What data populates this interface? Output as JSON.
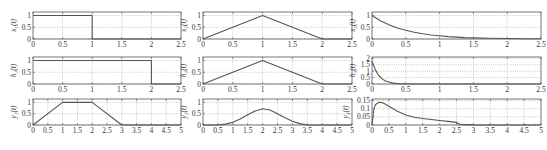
{
  "figure": {
    "top_caption_fragment": "",
    "bottom_caption_fragment": ""
  },
  "chart_data": [
    {
      "type": "line",
      "id": "x1",
      "ylabel": "x₁(t)",
      "row": 0,
      "col": 0,
      "xlim": [
        0,
        2.5
      ],
      "ylim": [
        0,
        1.15
      ],
      "xticks": [
        0,
        0.5,
        1,
        1.5,
        2,
        2.5
      ],
      "xtick_labels": [
        "0",
        "0.5",
        "1",
        "1.5",
        "2",
        "2.5"
      ],
      "yticks": [
        0,
        0.5,
        1
      ],
      "ytick_labels": [
        "0",
        "0.5",
        "1"
      ],
      "grid": true,
      "series": [
        {
          "name": "x1(t)",
          "x": [
            0,
            1,
            1,
            2.5
          ],
          "y": [
            1,
            1,
            0,
            0
          ]
        }
      ]
    },
    {
      "type": "line",
      "id": "x2",
      "ylabel": "x₂(t)",
      "row": 0,
      "col": 1,
      "xlim": [
        0,
        2.5
      ],
      "ylim": [
        0,
        1.15
      ],
      "xticks": [
        0,
        0.5,
        1,
        1.5,
        2,
        2.5
      ],
      "xtick_labels": [
        "0",
        "0.5",
        "1",
        "1.5",
        "2",
        "2.5"
      ],
      "yticks": [
        0,
        0.5,
        1
      ],
      "ytick_labels": [
        "0",
        "0.5",
        "1"
      ],
      "grid": true,
      "series": [
        {
          "name": "x2(t)",
          "x": [
            0,
            1,
            2,
            2.5
          ],
          "y": [
            0,
            1,
            0,
            0
          ]
        }
      ]
    },
    {
      "type": "line",
      "id": "x3",
      "ylabel": "x₃(t)",
      "row": 0,
      "col": 2,
      "xlim": [
        0,
        2.5
      ],
      "ylim": [
        0,
        1.15
      ],
      "xticks": [
        0,
        0.5,
        1,
        1.5,
        2,
        2.5
      ],
      "xtick_labels": [
        "0",
        "0.5",
        "1",
        "1.5",
        "2",
        "2.5"
      ],
      "yticks": [
        0,
        0.5,
        1
      ],
      "ytick_labels": [
        "0",
        "0.5",
        "1"
      ],
      "grid": true,
      "series": [
        {
          "name": "x3(t)",
          "x": [
            0,
            0.125,
            0.25,
            0.375,
            0.5,
            0.625,
            0.75,
            0.875,
            1,
            1.125,
            1.25,
            1.375,
            1.5,
            1.75,
            2,
            2.25,
            2.5
          ],
          "y": [
            1,
            0.78,
            0.61,
            0.47,
            0.37,
            0.29,
            0.22,
            0.17,
            0.14,
            0.1,
            0.08,
            0.06,
            0.05,
            0.03,
            0.02,
            0.01,
            0.01
          ]
        }
      ]
    },
    {
      "type": "line",
      "id": "h1",
      "ylabel": "h₁(t)",
      "row": 1,
      "col": 0,
      "xlim": [
        0,
        2.5
      ],
      "ylim": [
        0,
        1.15
      ],
      "xticks": [
        0,
        0.5,
        1,
        1.5,
        2,
        2.5
      ],
      "xtick_labels": [
        "0",
        "0.5",
        "1",
        "1.5",
        "2",
        "2.5"
      ],
      "yticks": [
        0,
        0.5,
        1
      ],
      "ytick_labels": [
        "0",
        "0.5",
        "1"
      ],
      "grid": true,
      "series": [
        {
          "name": "h1(t)",
          "x": [
            0,
            2,
            2,
            2.5
          ],
          "y": [
            1,
            1,
            0,
            0
          ]
        }
      ]
    },
    {
      "type": "line",
      "id": "h2",
      "ylabel": "h₂(t)",
      "row": 1,
      "col": 1,
      "xlim": [
        0,
        2.5
      ],
      "ylim": [
        0,
        1.15
      ],
      "xticks": [
        0,
        0.5,
        1,
        1.5,
        2,
        2.5
      ],
      "xtick_labels": [
        "0",
        "0.5",
        "1",
        "1.5",
        "2",
        "2.5"
      ],
      "yticks": [
        0,
        0.5,
        1
      ],
      "ytick_labels": [
        "0",
        "0.5",
        "1"
      ],
      "grid": true,
      "series": [
        {
          "name": "h2(t)",
          "x": [
            0,
            1,
            2,
            2.5
          ],
          "y": [
            0,
            1,
            0,
            0
          ]
        }
      ]
    },
    {
      "type": "line",
      "id": "h3",
      "ylabel": "h₃(t)",
      "row": 1,
      "col": 2,
      "xlim": [
        0,
        2.5
      ],
      "ylim": [
        0,
        2.1
      ],
      "xticks": [
        0,
        0.5,
        1,
        1.5,
        2,
        2.5
      ],
      "xtick_labels": [
        "0",
        "0.5",
        "1",
        "1.5",
        "2",
        "2.5"
      ],
      "yticks": [
        0,
        0.5,
        1,
        1.5,
        2
      ],
      "ytick_labels": [
        "0",
        "0.5",
        "1",
        "1.5",
        "2"
      ],
      "grid": true,
      "series": [
        {
          "name": "h3(t)",
          "x": [
            0,
            0.05,
            0.1,
            0.15,
            0.2,
            0.25,
            0.3,
            0.35,
            0.4,
            0.5,
            0.75,
            1,
            1.5,
            2,
            2.5
          ],
          "y": [
            1.8,
            1.1,
            0.66,
            0.4,
            0.24,
            0.15,
            0.09,
            0.05,
            0.03,
            0.01,
            0,
            0,
            0,
            0,
            0
          ]
        }
      ]
    },
    {
      "type": "line",
      "id": "y1",
      "ylabel": "y₁(t)",
      "row": 2,
      "col": 0,
      "xlim": [
        0,
        5
      ],
      "ylim": [
        0,
        1.15
      ],
      "xticks": [
        0,
        0.5,
        1,
        1.5,
        2,
        2.5,
        3,
        3.5,
        4,
        4.5,
        5
      ],
      "xtick_labels": [
        "0",
        "0.5",
        "1",
        "1.5",
        "2",
        "2.5",
        "3",
        "3.5",
        "4",
        "4.5",
        "5"
      ],
      "yticks": [
        0,
        0.5,
        1
      ],
      "ytick_labels": [
        "0",
        "0.5",
        "1"
      ],
      "grid": true,
      "series": [
        {
          "name": "y1(t)",
          "x": [
            0,
            1,
            2,
            3,
            5
          ],
          "y": [
            0,
            1,
            1,
            0,
            0
          ]
        }
      ]
    },
    {
      "type": "line",
      "id": "y2",
      "ylabel": "y₂(t)",
      "row": 2,
      "col": 1,
      "xlim": [
        0,
        5
      ],
      "ylim": [
        0,
        1.15
      ],
      "xticks": [
        0,
        0.5,
        1,
        1.5,
        2,
        2.5,
        3,
        3.5,
        4,
        4.5,
        5
      ],
      "xtick_labels": [
        "0",
        "0.5",
        "1",
        "1.5",
        "2",
        "2.5",
        "3",
        "3.5",
        "4",
        "4.5",
        "5"
      ],
      "yticks": [
        0,
        0.5,
        1
      ],
      "ytick_labels": [
        "0",
        "0.5",
        "1"
      ],
      "grid": true,
      "series": [
        {
          "name": "y2(t)",
          "x": [
            0,
            0.5,
            0.75,
            1,
            1.25,
            1.5,
            1.75,
            2,
            2.25,
            2.5,
            2.75,
            3,
            3.25,
            3.5,
            4,
            5
          ],
          "y": [
            0,
            0.0,
            0.04,
            0.12,
            0.27,
            0.45,
            0.62,
            0.72,
            0.66,
            0.5,
            0.32,
            0.17,
            0.06,
            0.0,
            0,
            0
          ]
        }
      ]
    },
    {
      "type": "line",
      "id": "y3",
      "ylabel": "y₃(t)",
      "row": 2,
      "col": 2,
      "xlim": [
        0,
        5
      ],
      "ylim": [
        0,
        0.16
      ],
      "xticks": [
        0,
        0.5,
        1,
        1.5,
        2,
        2.5,
        3,
        3.5,
        4,
        4.5,
        5
      ],
      "xtick_labels": [
        "0",
        "0.5",
        "1",
        "1.5",
        "2",
        "2.5",
        "3",
        "3.5",
        "4",
        "4.5",
        "5"
      ],
      "yticks": [
        0,
        0.05,
        0.1,
        0.15
      ],
      "ytick_labels": [
        "0",
        "0.05",
        "0.1",
        "0.15"
      ],
      "grid": true,
      "series": [
        {
          "name": "y3(t)",
          "x": [
            0,
            0.05,
            0.1,
            0.2,
            0.3,
            0.4,
            0.5,
            0.75,
            1,
            1.25,
            1.5,
            1.75,
            2,
            2.25,
            2.5,
            2.6,
            3,
            5
          ],
          "y": [
            0,
            0.09,
            0.125,
            0.14,
            0.138,
            0.128,
            0.115,
            0.085,
            0.062,
            0.048,
            0.04,
            0.034,
            0.028,
            0.022,
            0.016,
            0.004,
            0.001,
            0
          ]
        }
      ]
    }
  ]
}
